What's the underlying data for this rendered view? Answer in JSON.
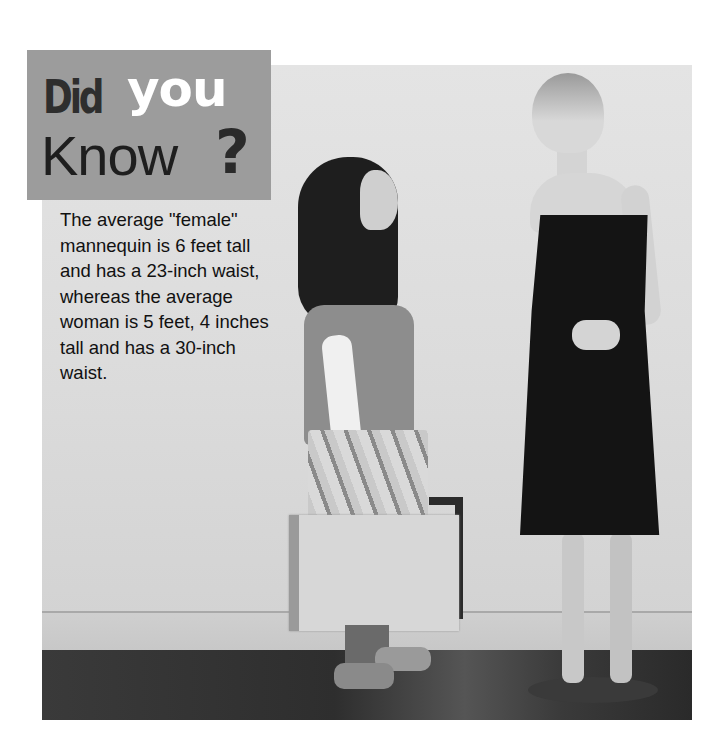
{
  "sidebar": {
    "title": {
      "word1": "Did",
      "word2": "you",
      "word3": "Know",
      "punctuation": "?"
    },
    "fact_text": "The average \"female\" mannequin is 6 feet tall and has a 23-inch waist, whereas the average woman is 5 feet, 4 inches tall and has a 30-inch waist."
  },
  "photo": {
    "description": "Grayscale photo of a young woman with a shopping bag looking up at a tall female mannequin in a black dress"
  },
  "colors": {
    "title_box": "#9c9c9c",
    "title_dark": "#2e2e2e",
    "title_light": "#ffffff",
    "text": "#111111"
  }
}
